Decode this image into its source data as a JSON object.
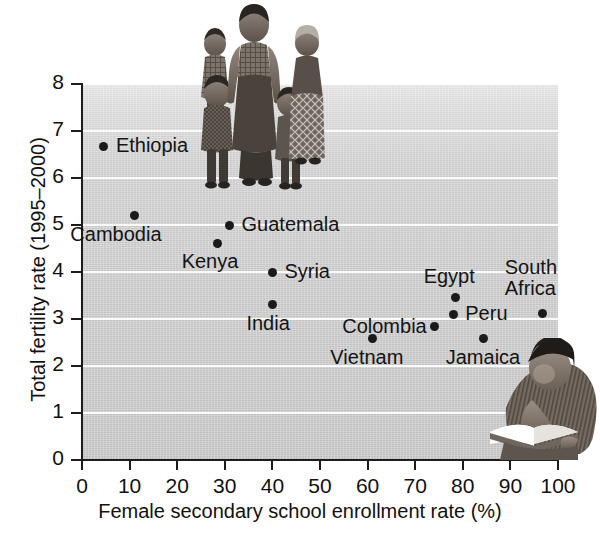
{
  "chart_data": {
    "type": "scatter",
    "title": "",
    "xlabel": "Female secondary school enrollment rate (%)",
    "ylabel": "Total fertility rate (1995–2000)",
    "xlim": [
      0,
      100
    ],
    "ylim": [
      0,
      8
    ],
    "xticks": [
      0,
      10,
      20,
      30,
      40,
      50,
      60,
      70,
      80,
      90,
      100
    ],
    "yticks": [
      0,
      1,
      2,
      3,
      4,
      5,
      6,
      7,
      8
    ],
    "grid": "horizontal",
    "legend": "none",
    "point_color": "#1a1a1a",
    "plot_background": "#cdcdcd",
    "gridline_color": "#fbfbfb",
    "points": [
      {
        "label": "Ethiopia",
        "x": 4.6,
        "y": 6.68,
        "label_dx": 12,
        "label_dy": -11
      },
      {
        "label": "Cambodia",
        "x": 11.0,
        "y": 5.2,
        "label_dx": -64,
        "label_dy": 8
      },
      {
        "label": "Guatemala",
        "x": 31.0,
        "y": 5.0,
        "label_dx": 12,
        "label_dy": -11
      },
      {
        "label": "Kenya",
        "x": 28.5,
        "y": 4.6,
        "label_dx": -36,
        "label_dy": 7
      },
      {
        "label": "Syria",
        "x": 40.0,
        "y": 4.0,
        "label_dx": 12,
        "label_dy": -11
      },
      {
        "label": "India",
        "x": 40.0,
        "y": 3.3,
        "label_dx": -26,
        "label_dy": 8
      },
      {
        "label": "Egypt",
        "x": 78.5,
        "y": 3.45,
        "label_dx": -32,
        "label_dy": -32
      },
      {
        "label": "South Africa",
        "x": 96.8,
        "y": 3.12,
        "label_dx": -38,
        "label_dy": -56
      },
      {
        "label": "Peru",
        "x": 78.0,
        "y": 3.1,
        "label_dx": 12,
        "label_dy": -11
      },
      {
        "label": "Colombia",
        "x": 74.0,
        "y": 2.85,
        "label_dx": -92,
        "label_dy": -10
      },
      {
        "label": "Vietnam",
        "x": 61.0,
        "y": 2.58,
        "label_dx": -42,
        "label_dy": 8
      },
      {
        "label": "Jamaica",
        "x": 84.4,
        "y": 2.58,
        "label_dx": -38,
        "label_dy": 8
      }
    ]
  },
  "axes": {
    "y_title": "Total fertility rate (1995–2000)",
    "x_title": "Female secondary school enrollment rate (%)",
    "y_tick_labels": [
      "8",
      "7",
      "6",
      "5",
      "4",
      "3",
      "2",
      "1",
      "0"
    ],
    "x_tick_labels": [
      "0",
      "10",
      "20",
      "30",
      "40",
      "50",
      "60",
      "70",
      "80",
      "90",
      "100"
    ]
  },
  "photos": {
    "family": "photo-family-mother-with-four-children",
    "reader": "photo-girl-reading-book"
  }
}
